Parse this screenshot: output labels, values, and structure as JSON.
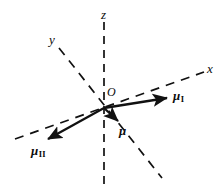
{
  "figure": {
    "name": "magnetic-moment-vector-diagram",
    "background_color": "#ffffff",
    "stroke_color": "#111111",
    "width": 222,
    "height": 196
  },
  "origin": {
    "label": "O",
    "x": 104,
    "y": 108
  },
  "axes": [
    {
      "id": "z",
      "label": "z",
      "style": "dashed",
      "label_x": 101,
      "label_y": 8,
      "from": {
        "x": 104,
        "y": 22
      },
      "to": {
        "x": 104,
        "y": 190
      }
    },
    {
      "id": "y",
      "label": "y",
      "style": "dashed",
      "label_x": 49,
      "label_y": 33,
      "from": {
        "x": 59,
        "y": 48
      },
      "to": {
        "x": 162,
        "y": 178
      }
    },
    {
      "id": "x",
      "label": "x",
      "style": "dashed",
      "label_x": 207,
      "label_y": 62,
      "from": {
        "x": 15,
        "y": 139
      },
      "to": {
        "x": 204,
        "y": 72
      }
    }
  ],
  "vectors": [
    {
      "id": "mu-I",
      "label": "μ",
      "subscript": "I",
      "style": "solid-arrow",
      "from": {
        "x": 104,
        "y": 108
      },
      "to": {
        "x": 171,
        "y": 97
      },
      "label_x": 173,
      "label_y": 89
    },
    {
      "id": "mu-II",
      "label": "μ",
      "subscript": "II",
      "style": "solid-arrow",
      "from": {
        "x": 104,
        "y": 108
      },
      "to": {
        "x": 43,
        "y": 142
      },
      "label_x": 31,
      "label_y": 144
    },
    {
      "id": "mu",
      "label": "μ",
      "subscript": "",
      "style": "solid-arrow",
      "from": {
        "x": 104,
        "y": 108
      },
      "to": {
        "x": 122,
        "y": 125
      },
      "label_x": 119,
      "label_y": 124
    }
  ]
}
